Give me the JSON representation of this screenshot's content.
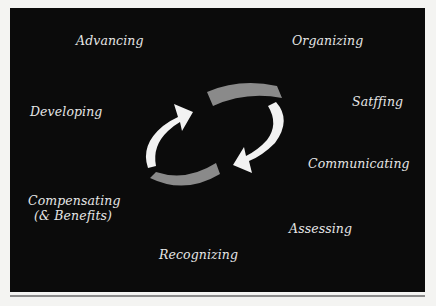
{
  "diagram": {
    "title": "",
    "colors": {
      "background": "#0b0b0b",
      "page": "#f4f4f2",
      "text": "#e6e6e6",
      "arrow_white": "#f2f2f2",
      "arrow_gray": "#8a8a8a",
      "rule": "#8c8c8c"
    },
    "labels": {
      "advancing": "Advancing",
      "organizing": "Organizing",
      "developing": "Developing",
      "staffing": "Satffing",
      "communicating": "Communicating",
      "compensating_line1": "Compensating",
      "compensating_line2": "(& Benefits)",
      "assessing": "Assessing",
      "recognizing": "Recognizing"
    },
    "center_graphic": {
      "type": "cycle-arrows",
      "direction": "clockwise",
      "arrows": [
        "white",
        "gray",
        "white",
        "gray"
      ]
    }
  }
}
